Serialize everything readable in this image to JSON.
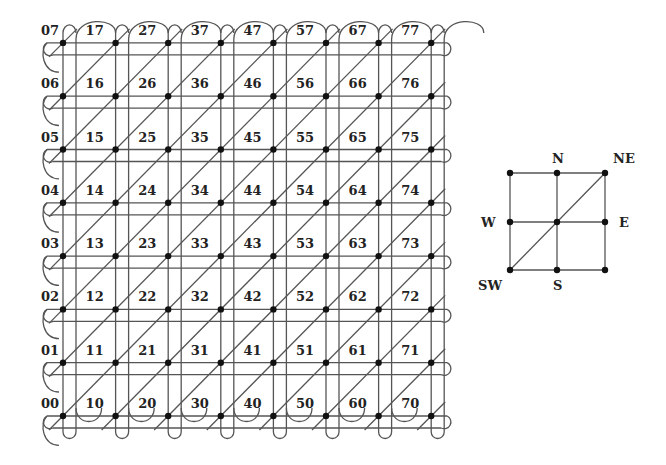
{
  "grid": {
    "size": 8,
    "origin_px": [
      63,
      416
    ],
    "step_px": [
      52.6,
      53.3
    ],
    "labels": [
      [
        "00",
        "01",
        "02",
        "03",
        "04",
        "05",
        "06",
        "07"
      ],
      [
        "10",
        "11",
        "12",
        "13",
        "14",
        "15",
        "16",
        "17"
      ],
      [
        "20",
        "21",
        "22",
        "23",
        "24",
        "25",
        "26",
        "27"
      ],
      [
        "30",
        "31",
        "32",
        "33",
        "34",
        "35",
        "36",
        "37"
      ],
      [
        "40",
        "41",
        "42",
        "43",
        "44",
        "45",
        "46",
        "47"
      ],
      [
        "50",
        "51",
        "52",
        "53",
        "54",
        "55",
        "56",
        "57"
      ],
      [
        "60",
        "61",
        "62",
        "63",
        "64",
        "65",
        "66",
        "67"
      ],
      [
        "70",
        "71",
        "72",
        "73",
        "74",
        "75",
        "76",
        "77"
      ]
    ],
    "line_color": "#555555",
    "dot_color": "#111111"
  },
  "stencil": {
    "labels": {
      "N": "N",
      "NE": "NE",
      "W": "W",
      "E": "E",
      "SW": "SW",
      "S": "S"
    }
  }
}
